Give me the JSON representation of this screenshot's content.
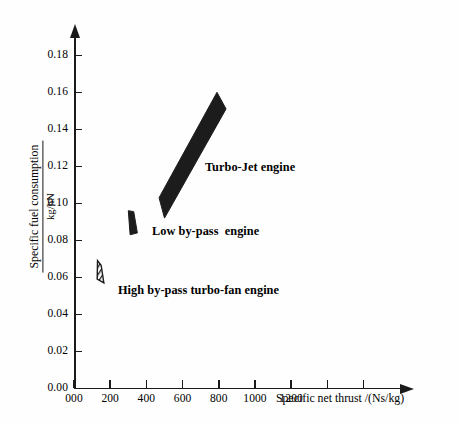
{
  "chart_data": {
    "type": "scatter",
    "title": "",
    "xlabel": "Specific net thrust /(Ns/kg)",
    "ylabel_numerator": "Specific fuel consumption",
    "ylabel_denominator": "kg/hN",
    "xlim": [
      0,
      1600
    ],
    "ylim": [
      0.0,
      0.19
    ],
    "grid": false,
    "legend": "none",
    "x_ticks": [
      {
        "value": 0,
        "label": "000"
      },
      {
        "value": 200,
        "label": "200"
      },
      {
        "value": 400,
        "label": "400"
      },
      {
        "value": 600,
        "label": "600"
      },
      {
        "value": 800,
        "label": "800"
      },
      {
        "value": 1000,
        "label": "1000"
      },
      {
        "value": 1200,
        "label": "1200"
      },
      {
        "value": 1400,
        "label": ""
      },
      {
        "value": 1600,
        "label": ""
      }
    ],
    "y_ticks": [
      {
        "value": 0.0,
        "label": "0.00"
      },
      {
        "value": 0.02,
        "label": "0.02"
      },
      {
        "value": 0.04,
        "label": "0.04"
      },
      {
        "value": 0.06,
        "label": "0.06"
      },
      {
        "value": 0.08,
        "label": "0.08"
      },
      {
        "value": 0.1,
        "label": "0.10"
      },
      {
        "value": 0.12,
        "label": "0.12"
      },
      {
        "value": 0.14,
        "label": "0.14"
      },
      {
        "value": 0.16,
        "label": "0.16"
      },
      {
        "value": 0.18,
        "label": "0.18"
      }
    ],
    "regions": [
      {
        "name": "turbo-jet",
        "label": "Turbo-Jet engine",
        "fill": "#1c1c1c",
        "hatch": "solid",
        "polygon_data": [
          [
            470,
            0.103
          ],
          [
            790,
            0.16
          ],
          [
            840,
            0.151
          ],
          [
            500,
            0.092
          ]
        ],
        "x_range": [
          470,
          840
        ],
        "y_range": [
          0.092,
          0.16
        ]
      },
      {
        "name": "low-by-pass",
        "label": "Low by-pass  engine",
        "fill": "#1c1c1c",
        "hatch": "solid",
        "polygon_data": [
          [
            300,
            0.096
          ],
          [
            330,
            0.0955
          ],
          [
            350,
            0.084
          ],
          [
            310,
            0.083
          ]
        ],
        "x_range": [
          300,
          350
        ],
        "y_range": [
          0.083,
          0.096
        ]
      },
      {
        "name": "high-by-pass-turbo-fan",
        "label": "High by-pass turbo-fan engine",
        "fill": "#1c1c1c",
        "hatch": "diagonal-lines",
        "polygon_data": [
          [
            130,
            0.069
          ],
          [
            150,
            0.0665
          ],
          [
            165,
            0.057
          ],
          [
            128,
            0.059
          ]
        ],
        "x_range": [
          128,
          165
        ],
        "y_range": [
          0.057,
          0.069
        ]
      }
    ]
  },
  "annotations": {
    "turbojet": "Turbo-Jet engine",
    "lowbypass": "Low by-pass  engine",
    "highbypass": "High by-pass turbo-fan engine"
  },
  "axes": {
    "x_title": "Specific net thrust /(Ns/kg)",
    "y_title_numerator": "Specific fuel consumption",
    "y_title_denominator": "kg/hN"
  },
  "colors": {
    "axis": "#1a1a1a",
    "region_fill": "#1c1c1c",
    "background": "#fefefe"
  }
}
